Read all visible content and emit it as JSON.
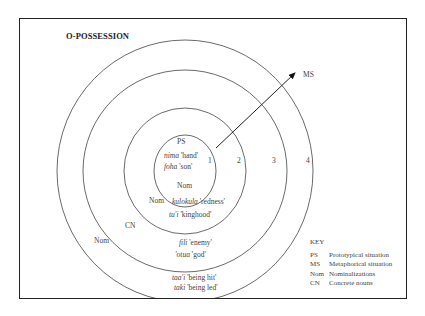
{
  "title": "O-POSSESSION",
  "arrow_label": "MS",
  "zones": {
    "zone1": {
      "number": "1",
      "label_top": "PS",
      "examples": [
        {
          "word": "nima",
          "gloss": "'hand'"
        },
        {
          "word": "foha",
          "gloss": "'son'"
        }
      ],
      "label_bottom": "Nom"
    },
    "zone2": {
      "number": "2",
      "label": "Nom",
      "examples": [
        {
          "word": "kulokula",
          "gloss": "'redness'"
        },
        {
          "word": "tu'i",
          "gloss": "'kinghood'"
        }
      ]
    },
    "zone3": {
      "number": "3",
      "label": "CN",
      "examples": [
        {
          "word": "fili",
          "gloss": "'enemy'"
        },
        {
          "word": "'otua",
          "gloss": "'god'"
        }
      ]
    },
    "zone4": {
      "number": "4",
      "label": "Nom",
      "examples": [
        {
          "word": "taa'i",
          "gloss": "'being hit'"
        },
        {
          "word": "taki",
          "gloss": "'being led'"
        }
      ]
    }
  },
  "key": {
    "heading": "KEY",
    "items": [
      {
        "abbr": "PS",
        "meaning": "Prototypical situation"
      },
      {
        "abbr": "MS",
        "meaning": "Metaphorical situation"
      },
      {
        "abbr": "Nom",
        "meaning": "Nominalizations"
      },
      {
        "abbr": "CN",
        "meaning": "Concrete nouns"
      }
    ]
  },
  "colors": {
    "line": "#333333",
    "text": "#444444",
    "frame": "#222222"
  }
}
